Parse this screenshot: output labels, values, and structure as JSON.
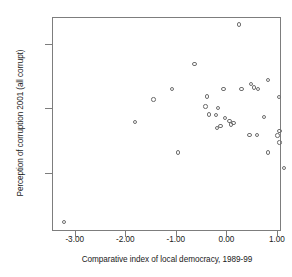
{
  "chart_data": {
    "type": "scatter",
    "title": "",
    "xlabel": "Comparative index of local democracy, 1989-99",
    "ylabel": "Perception of corruption 2001 (all corrupt)",
    "xlim": [
      -3.45,
      1.08
    ],
    "ylim": [
      60.9,
      94.2
    ],
    "grid": false,
    "legend": null,
    "xticks": [
      -3.0,
      -2.0,
      -1.0,
      0.0,
      1.0
    ],
    "xtick_labels": [
      "-3.00",
      "-2.00",
      "-1.00",
      "0.00",
      "1.00"
    ],
    "yticks": [
      90.0,
      80.0,
      70.0
    ],
    "ytick_labels": [
      "90.0",
      "80.0",
      "70.0"
    ],
    "marker": "open-circle",
    "marker_color": "#6e6e6e",
    "points": [
      {
        "x": -3.23,
        "y": 62.5
      },
      {
        "x": -1.83,
        "y": 78.0
      },
      {
        "x": -1.46,
        "y": 81.5
      },
      {
        "x": -1.1,
        "y": 83.2
      },
      {
        "x": -0.98,
        "y": 73.3
      },
      {
        "x": -0.65,
        "y": 87.0
      },
      {
        "x": -0.4,
        "y": 82.0
      },
      {
        "x": -0.43,
        "y": 80.4
      },
      {
        "x": -0.37,
        "y": 79.2
      },
      {
        "x": -0.23,
        "y": 79.1
      },
      {
        "x": -0.19,
        "y": 80.2
      },
      {
        "x": -0.2,
        "y": 77.1
      },
      {
        "x": -0.14,
        "y": 77.4
      },
      {
        "x": -0.08,
        "y": 83.2
      },
      {
        "x": -0.05,
        "y": 78.6
      },
      {
        "x": 0.04,
        "y": 78.2
      },
      {
        "x": 0.07,
        "y": 77.6
      },
      {
        "x": 0.12,
        "y": 77.9
      },
      {
        "x": 0.23,
        "y": 93.2
      },
      {
        "x": 0.28,
        "y": 83.2
      },
      {
        "x": 0.44,
        "y": 76.0
      },
      {
        "x": 0.47,
        "y": 83.9
      },
      {
        "x": 0.52,
        "y": 83.4
      },
      {
        "x": 0.58,
        "y": 76.0
      },
      {
        "x": 0.6,
        "y": 83.2
      },
      {
        "x": 0.72,
        "y": 78.8
      },
      {
        "x": 0.8,
        "y": 84.6
      },
      {
        "x": 0.8,
        "y": 73.3
      },
      {
        "x": 0.99,
        "y": 75.9
      },
      {
        "x": 1.02,
        "y": 81.9
      },
      {
        "x": 1.03,
        "y": 76.6
      },
      {
        "x": 1.03,
        "y": 74.8
      },
      {
        "x": 1.12,
        "y": 70.9
      }
    ]
  }
}
